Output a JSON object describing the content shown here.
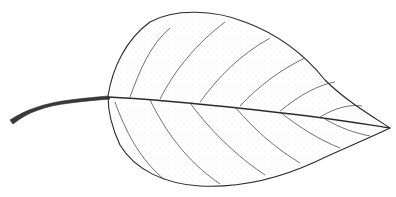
{
  "figure": {
    "style": "pen-and-ink stipple botanical illustration",
    "colors": {
      "background": "#ffffff",
      "ink": "#2a2a2a",
      "stipple": "#555555"
    }
  }
}
